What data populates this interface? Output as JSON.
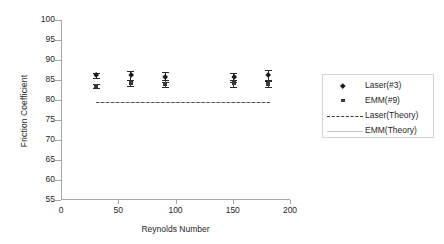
{
  "chart_data": {
    "type": "scatter",
    "title": "",
    "xlabel": "Reynolds Number",
    "ylabel": "Friction Coefficient",
    "xlim": [
      0,
      200
    ],
    "ylim": [
      55,
      100
    ],
    "xticks": [
      0,
      50,
      100,
      150,
      200
    ],
    "yticks": [
      55,
      60,
      65,
      70,
      75,
      80,
      85,
      90,
      95,
      100
    ],
    "grid": false,
    "legend_position": "right",
    "x": [
      30,
      60,
      90,
      150,
      180
    ],
    "series": [
      {
        "name": "Laser(#3)",
        "marker": "diamond",
        "values": [
          86.1,
          86.1,
          85.8,
          85.6,
          86.1
        ],
        "errors": [
          0.7,
          1.1,
          1.3,
          1.2,
          1.3
        ]
      },
      {
        "name": "EMM(#9)",
        "marker": "square",
        "values": [
          83.6,
          84.2,
          84.1,
          84.2,
          84.1
        ],
        "errors": [
          0.5,
          0.8,
          0.9,
          0.9,
          0.9
        ]
      },
      {
        "name": "Laser(Theory)",
        "marker": "dashed-line",
        "constant": 79.6
      },
      {
        "name": "EMM(Theory)",
        "marker": "solid-line",
        "constant": 79.4
      }
    ],
    "legend_entries": [
      "Laser(#3)",
      "EMM(#9)",
      "Laser(Theory)",
      "EMM(Theory)"
    ],
    "colors": {
      "laser_marker": "#1a1a1a",
      "emm_marker": "#3a3a3a",
      "laser_theory_line": "#3b3b3b",
      "emm_theory_line": "#bfbfbf",
      "axis": "#a6a6a6",
      "text": "#262626",
      "background": "#ffffff"
    }
  }
}
